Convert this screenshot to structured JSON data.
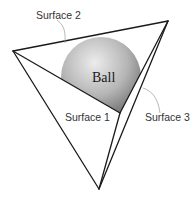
{
  "diagram": {
    "type": "geometry-illustration",
    "labels": {
      "ball": "Ball",
      "surface_1": "Surface 1",
      "surface_2": "Surface 2",
      "surface_3": "Surface 3"
    },
    "colors": {
      "edge": "#1a1a1a",
      "leader": "#9a9a9a",
      "ball_light": "#e6e6e6",
      "ball_dark": "#6e6e6e",
      "background": "#ffffff"
    },
    "vertices": {
      "left": [
        13,
        51
      ],
      "top_right": [
        168,
        21
      ],
      "bottom": [
        99,
        189
      ],
      "inner": [
        120,
        113
      ]
    }
  }
}
